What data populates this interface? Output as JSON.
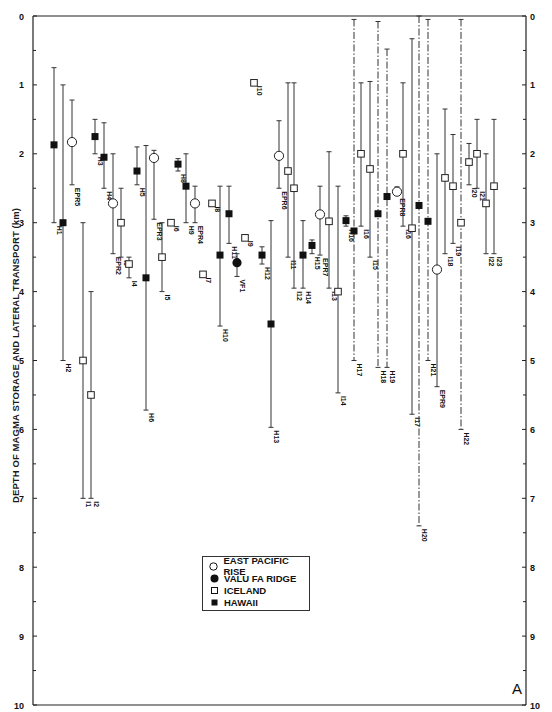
{
  "chart_data": {
    "type": "scatter",
    "title": "",
    "xlabel": "",
    "ylabel": "DEPTH OF MAGMA STORAGE AND LATERAL TRANSPORT (km)",
    "ylim": [
      0,
      10
    ],
    "y_inverted": true,
    "y_ticks": [
      0,
      1,
      2,
      3,
      4,
      5,
      6,
      7,
      8,
      9,
      10
    ],
    "grid": false,
    "legend_position": "lower-left-center (inside plot)",
    "panel_label": "A",
    "series": [
      {
        "name": "EAST PACIFIC RISE",
        "marker": "open-circle"
      },
      {
        "name": "VALU FA RIDGE",
        "marker": "filled-circle"
      },
      {
        "name": "ICELAND",
        "marker": "open-square"
      },
      {
        "name": "HAWAII",
        "marker": "filled-square"
      }
    ],
    "points": [
      {
        "label": "H1",
        "series": "HAWAII",
        "x": 54,
        "depth": 1.87,
        "min": 0.75,
        "max": 3.0,
        "line": "solid"
      },
      {
        "label": "H2",
        "series": "HAWAII",
        "x": 63,
        "depth": 3.0,
        "min": 1.0,
        "max": 5.0,
        "line": "solid"
      },
      {
        "label": "EPR5",
        "series": "EAST PACIFIC RISE",
        "x": 72,
        "depth": 1.83,
        "min": 1.22,
        "max": 2.45,
        "line": "solid"
      },
      {
        "label": "I1",
        "series": "ICELAND",
        "x": 83,
        "depth": 5.0,
        "min": 3.0,
        "max": 7.0,
        "line": "solid"
      },
      {
        "label": "I2",
        "series": "ICELAND",
        "x": 91,
        "depth": 5.5,
        "min": 4.0,
        "max": 7.0,
        "line": "solid"
      },
      {
        "label": "H3",
        "series": "HAWAII",
        "x": 95,
        "depth": 1.75,
        "min": 1.5,
        "max": 2.0,
        "line": "solid"
      },
      {
        "label": "H4",
        "series": "HAWAII",
        "x": 104,
        "depth": 2.05,
        "min": 1.55,
        "max": 2.5,
        "line": "solid"
      },
      {
        "label": "EPR2",
        "series": "EAST PACIFIC RISE",
        "x": 113,
        "depth": 2.72,
        "min": 2.0,
        "max": 3.45,
        "line": "solid"
      },
      {
        "label": "I3",
        "series": "ICELAND",
        "x": 121,
        "depth": 3.0,
        "min": 2.5,
        "max": 3.5,
        "line": "solid"
      },
      {
        "label": "I4",
        "series": "ICELAND",
        "x": 129,
        "depth": 3.6,
        "min": 3.5,
        "max": 3.8,
        "line": "solid"
      },
      {
        "label": "H5",
        "series": "HAWAII",
        "x": 137,
        "depth": 2.25,
        "min": 1.9,
        "max": 2.45,
        "line": "solid"
      },
      {
        "label": "H6",
        "series": "HAWAII",
        "x": 146,
        "depth": 3.8,
        "min": 1.88,
        "max": 5.72,
        "line": "solid"
      },
      {
        "label": "EPR3",
        "series": "EAST PACIFIC RISE",
        "x": 154,
        "depth": 2.06,
        "min": 1.95,
        "max": 2.95,
        "line": "solid"
      },
      {
        "label": "I5",
        "series": "ICELAND",
        "x": 162,
        "depth": 3.5,
        "min": 3.0,
        "max": 4.0,
        "line": "solid"
      },
      {
        "label": "I6",
        "series": "ICELAND",
        "x": 171,
        "depth": 3.0,
        "min": null,
        "max": null,
        "line": "none"
      },
      {
        "label": "H8",
        "series": "HAWAII",
        "x": 178,
        "depth": 2.15,
        "min": 2.07,
        "max": 2.25,
        "line": "solid"
      },
      {
        "label": "H9",
        "series": "HAWAII",
        "x": 186,
        "depth": 2.47,
        "min": 2.0,
        "max": 3.0,
        "line": "solid"
      },
      {
        "label": "EPR4",
        "series": "EAST PACIFIC RISE",
        "x": 195,
        "depth": 2.72,
        "min": 2.47,
        "max": 3.0,
        "line": "solid"
      },
      {
        "label": "I7",
        "series": "ICELAND",
        "x": 203,
        "depth": 3.75,
        "min": null,
        "max": null,
        "line": "none"
      },
      {
        "label": "I8",
        "series": "ICELAND",
        "x": 212,
        "depth": 2.72,
        "min": null,
        "max": null,
        "line": "none"
      },
      {
        "label": "H10",
        "series": "HAWAII",
        "x": 220,
        "depth": 3.47,
        "min": 2.47,
        "max": 4.5,
        "line": "solid"
      },
      {
        "label": "H11",
        "series": "HAWAII",
        "x": 229,
        "depth": 2.87,
        "min": 2.47,
        "max": 3.3,
        "line": "solid"
      },
      {
        "label": "VF1",
        "series": "VALU FA RIDGE",
        "x": 237,
        "depth": 3.58,
        "min": 3.45,
        "max": 3.78,
        "line": "solid"
      },
      {
        "label": "I9",
        "series": "ICELAND",
        "x": 245,
        "depth": 3.22,
        "min": null,
        "max": null,
        "line": "none"
      },
      {
        "label": "I10",
        "series": "ICELAND",
        "x": 254,
        "depth": 0.97,
        "min": null,
        "max": null,
        "line": "none"
      },
      {
        "label": "H12",
        "series": "HAWAII",
        "x": 262,
        "depth": 3.47,
        "min": 3.35,
        "max": 3.6,
        "line": "solid"
      },
      {
        "label": "H13",
        "series": "HAWAII",
        "x": 271,
        "depth": 4.47,
        "min": 2.97,
        "max": 5.97,
        "line": "solid"
      },
      {
        "label": "EPR6",
        "series": "EAST PACIFIC RISE",
        "x": 279,
        "depth": 2.03,
        "min": 1.52,
        "max": 2.5,
        "line": "solid"
      },
      {
        "label": "I11",
        "series": "ICELAND",
        "x": 288,
        "depth": 2.25,
        "min": 0.97,
        "max": 3.5,
        "line": "solid"
      },
      {
        "label": "I12",
        "series": "ICELAND",
        "x": 294,
        "depth": 2.5,
        "min": 0.97,
        "max": 3.95,
        "line": "solid"
      },
      {
        "label": "H14",
        "series": "HAWAII",
        "x": 303,
        "depth": 3.47,
        "min": 2.97,
        "max": 3.95,
        "line": "solid"
      },
      {
        "label": "H15",
        "series": "HAWAII",
        "x": 312,
        "depth": 3.33,
        "min": 3.25,
        "max": 3.45,
        "line": "solid"
      },
      {
        "label": "EPR7",
        "series": "EAST PACIFIC RISE",
        "x": 320,
        "depth": 2.88,
        "min": 2.47,
        "max": 3.47,
        "line": "solid"
      },
      {
        "label": "I13",
        "series": "ICELAND",
        "x": 329,
        "depth": 2.98,
        "min": 1.97,
        "max": 3.95,
        "line": "solid"
      },
      {
        "label": "I14",
        "series": "ICELAND",
        "x": 338,
        "depth": 4.0,
        "min": 2.47,
        "max": 5.47,
        "line": "solid"
      },
      {
        "label": "H16",
        "series": "HAWAII",
        "x": 346,
        "depth": 2.97,
        "min": 2.9,
        "max": 3.05,
        "line": "solid"
      },
      {
        "label": "H17",
        "series": "HAWAII",
        "x": 354,
        "depth": 3.12,
        "min": 0.05,
        "max": 5.0,
        "line": "dashdot"
      },
      {
        "label": "I16",
        "series": "ICELAND",
        "x": 361,
        "depth": 2.0,
        "min": 0.97,
        "max": 3.05,
        "line": "solid"
      },
      {
        "label": "I15",
        "series": "ICELAND",
        "x": 370,
        "depth": 2.22,
        "min": 0.95,
        "max": 3.5,
        "line": "solid"
      },
      {
        "label": "H18",
        "series": "HAWAII",
        "x": 378,
        "depth": 2.87,
        "min": 0.08,
        "max": 5.1,
        "line": "dashdot"
      },
      {
        "label": "H19",
        "series": "HAWAII",
        "x": 387,
        "depth": 2.62,
        "min": 0.48,
        "max": 5.1,
        "line": "dashdot"
      },
      {
        "label": "EPR8",
        "series": "EAST PACIFIC RISE",
        "x": 397,
        "depth": 2.55,
        "min": 2.48,
        "max": 2.6,
        "line": "solid"
      },
      {
        "label": "I16",
        "series": "ICELAND",
        "x": 403,
        "depth": 2.0,
        "min": 0.97,
        "max": 3.05,
        "line": "solid"
      },
      {
        "label": "I17",
        "series": "ICELAND",
        "x": 412,
        "depth": 3.08,
        "min": 0.33,
        "max": 5.78,
        "line": "solid"
      },
      {
        "label": "H20",
        "series": "HAWAII",
        "x": 419,
        "depth": 2.75,
        "min": 0.0,
        "max": 7.4,
        "line": "dashdot"
      },
      {
        "label": "H21",
        "series": "HAWAII",
        "x": 428,
        "depth": 2.98,
        "min": 0.05,
        "max": 5.0,
        "line": "dashdot"
      },
      {
        "label": "EPR9",
        "series": "EAST PACIFIC RISE",
        "x": 437,
        "depth": 3.68,
        "min": 2.0,
        "max": 5.38,
        "line": "solid"
      },
      {
        "label": "I18",
        "series": "ICELAND",
        "x": 445,
        "depth": 2.35,
        "min": 1.35,
        "max": 3.45,
        "line": "solid"
      },
      {
        "label": "I19",
        "series": "ICELAND",
        "x": 453,
        "depth": 2.47,
        "min": 1.72,
        "max": 3.3,
        "line": "solid"
      },
      {
        "label": "H22",
        "series": "ICELAND",
        "x": 461,
        "depth": 3.0,
        "min": 0.05,
        "max": 6.0,
        "line": "dashdot"
      },
      {
        "label": "I20",
        "series": "ICELAND",
        "x": 469,
        "depth": 2.12,
        "min": 1.85,
        "max": 2.45,
        "line": "solid"
      },
      {
        "label": "I21",
        "series": "ICELAND",
        "x": 477,
        "depth": 2.0,
        "min": 1.5,
        "max": 2.5,
        "line": "solid"
      },
      {
        "label": "I22",
        "series": "ICELAND",
        "x": 486,
        "depth": 2.72,
        "min": 2.0,
        "max": 3.45,
        "line": "solid"
      },
      {
        "label": "I23",
        "series": "ICELAND",
        "x": 494,
        "depth": 2.47,
        "min": 1.5,
        "max": 3.45,
        "line": "solid"
      }
    ]
  },
  "axis": {
    "ylabel": "DEPTH OF MAGMA STORAGE AND LATERAL TRANSPORT (km)"
  },
  "legend": {
    "items": [
      {
        "label": "EAST PACIFIC RISE",
        "marker": "open-circle"
      },
      {
        "label": "VALU FA RIDGE",
        "marker": "filled-circle"
      },
      {
        "label": "ICELAND",
        "marker": "open-square"
      },
      {
        "label": "HAWAII",
        "marker": "filled-square"
      }
    ]
  },
  "panel_label": "A"
}
